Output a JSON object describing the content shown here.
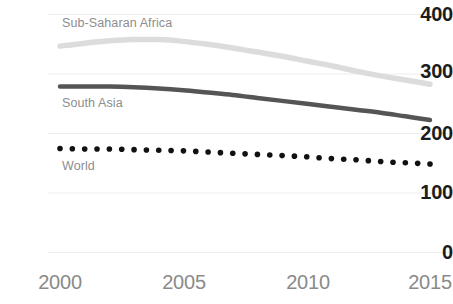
{
  "chart_data": {
    "type": "line",
    "title": "",
    "subtitle": "",
    "xlabel": "",
    "ylabel": "",
    "xlim": [
      2000,
      2015
    ],
    "ylim": [
      0,
      400
    ],
    "x": [
      2000,
      2001,
      2002,
      2003,
      2004,
      2005,
      2006,
      2007,
      2008,
      2009,
      2010,
      2011,
      2012,
      2013,
      2014,
      2015
    ],
    "x_ticks": [
      "2000",
      "2005",
      "2010",
      "2015"
    ],
    "x_tick_values": [
      2000,
      2005,
      2010,
      2015
    ],
    "y_ticks": [
      "0",
      "100",
      "200",
      "300",
      "400"
    ],
    "y_tick_values": [
      0,
      100,
      200,
      300,
      400
    ],
    "grid": "horizontal",
    "legend_position": "inline-labels",
    "series": [
      {
        "name": "Sub-Saharan Africa",
        "color": "#dcdcdc",
        "style": "solid",
        "values": [
          346,
          351,
          355,
          357,
          357,
          354,
          349,
          343,
          336,
          329,
          321,
          313,
          304,
          296,
          289,
          282
        ]
      },
      {
        "name": "South Asia",
        "color": "#555555",
        "style": "solid",
        "values": [
          278,
          278,
          278,
          277,
          275,
          272,
          268,
          264,
          259,
          254,
          249,
          244,
          239,
          234,
          228,
          222
        ]
      },
      {
        "name": "World",
        "color": "#111111",
        "style": "dotted",
        "values": [
          174,
          173,
          173,
          172,
          171,
          170,
          168,
          166,
          164,
          162,
          160,
          157,
          155,
          152,
          150,
          148
        ]
      }
    ]
  },
  "axis": {
    "y_labels": [
      {
        "text": "400",
        "value": 400
      },
      {
        "text": "300",
        "value": 300
      },
      {
        "text": "200",
        "value": 200
      },
      {
        "text": "100",
        "value": 100
      },
      {
        "text": "0",
        "value": 0
      }
    ],
    "x_labels": [
      {
        "text": "2000",
        "value": 2000
      },
      {
        "text": "2005",
        "value": 2005
      },
      {
        "text": "2010",
        "value": 2010
      },
      {
        "text": "2015",
        "value": 2015
      }
    ]
  },
  "series_labels": [
    {
      "text": "Sub-Saharan Africa"
    },
    {
      "text": "South Asia"
    },
    {
      "text": "World"
    }
  ],
  "colors": {
    "sub_saharan_africa": "#dcdcdc",
    "south_asia": "#555555",
    "world": "#111111",
    "gridline": "#ededed",
    "tick_label": "#1c1c1c",
    "x_tick_label": "#8a8a8a",
    "series_label": "#8d8d8d",
    "background": "#ffffff"
  }
}
